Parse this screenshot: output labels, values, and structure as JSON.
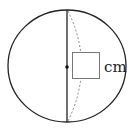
{
  "diagram": {
    "answer_box": {
      "value": "",
      "unit": "cm"
    },
    "colors": {
      "stroke": "#222222",
      "dashed": "#888888",
      "box": "#777777"
    }
  }
}
